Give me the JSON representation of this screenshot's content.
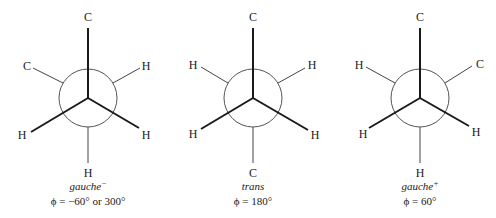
{
  "figure": {
    "colors": {
      "ink": "#1a1a1a",
      "back_bond": "#444444",
      "ring": "#555555",
      "background": "#ffffff"
    },
    "projections": [
      {
        "id": "gauche-minus",
        "name": "gauche",
        "name_sup": "−",
        "phi_label": "ϕ = −60° or 300°",
        "front_atoms": {
          "top": "C",
          "lower_left": "H",
          "lower_right": "H"
        },
        "back_atoms": {
          "upper_left": "C",
          "upper_right": "H",
          "bottom": "H"
        }
      },
      {
        "id": "trans",
        "name": "trans",
        "name_sup": "",
        "phi_label": "ϕ = 180°",
        "front_atoms": {
          "top": "C",
          "lower_left": "H",
          "lower_right": "H"
        },
        "back_atoms": {
          "upper_left": "H",
          "upper_right": "H",
          "bottom": "C"
        }
      },
      {
        "id": "gauche-plus",
        "name": "gauche",
        "name_sup": "+",
        "phi_label": "ϕ = 60°",
        "front_atoms": {
          "top": "C",
          "lower_left": "H",
          "lower_right": "H"
        },
        "back_atoms": {
          "upper_left": "H",
          "upper_right": "C",
          "bottom": "H"
        }
      }
    ]
  }
}
